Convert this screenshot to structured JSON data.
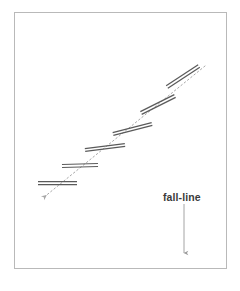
{
  "figure": {
    "name": "ski-traverse-switchback-diagram",
    "background_color": "#ffffff",
    "frame": {
      "border_color": "#b9b9b9",
      "fill_color": "#ffffff",
      "x": 14,
      "y": 12,
      "width": 213,
      "height": 257
    },
    "annotation": {
      "fall_line_label": "fall-line",
      "label_x": 163,
      "label_y": 191,
      "arrow_color": "#9a9a9a",
      "arrow_start_x": 184,
      "arrow_start_y": 204,
      "arrow_end_x": 184,
      "arrow_end_y": 253
    },
    "guide_line": {
      "name": "ascent-guide-dotted-line",
      "color": "#a8a8a8",
      "dash": "1.6 2.6",
      "width": 1,
      "x1": 205,
      "y1": 66,
      "x2": 43,
      "y2": 198,
      "arrow_at": "lower-left"
    },
    "track_color": "#5a5a5a",
    "track_line_width": 1.25,
    "track_gap": 3.0,
    "tracks": [
      {
        "id": 1,
        "label": "track-segment-1",
        "x1": 38.0,
        "y1": 183.0,
        "x2": 77.0,
        "y2": 183.0
      },
      {
        "id": 2,
        "label": "track-segment-2",
        "x1": 62.0,
        "y1": 166.0,
        "x2": 98.0,
        "y2": 165.0
      },
      {
        "id": 3,
        "label": "track-segment-3",
        "x1": 85.0,
        "y1": 150.0,
        "x2": 125.0,
        "y2": 145.0
      },
      {
        "id": 4,
        "label": "track-segment-4",
        "x1": 113.0,
        "y1": 134.0,
        "x2": 152.0,
        "y2": 124.0
      },
      {
        "id": 5,
        "label": "track-segment-5",
        "x1": 141.0,
        "y1": 113.0,
        "x2": 175.0,
        "y2": 96.0
      },
      {
        "id": 6,
        "label": "track-segment-6",
        "x1": 167.0,
        "y1": 87.0,
        "x2": 199.0,
        "y2": 66.0
      }
    ]
  }
}
